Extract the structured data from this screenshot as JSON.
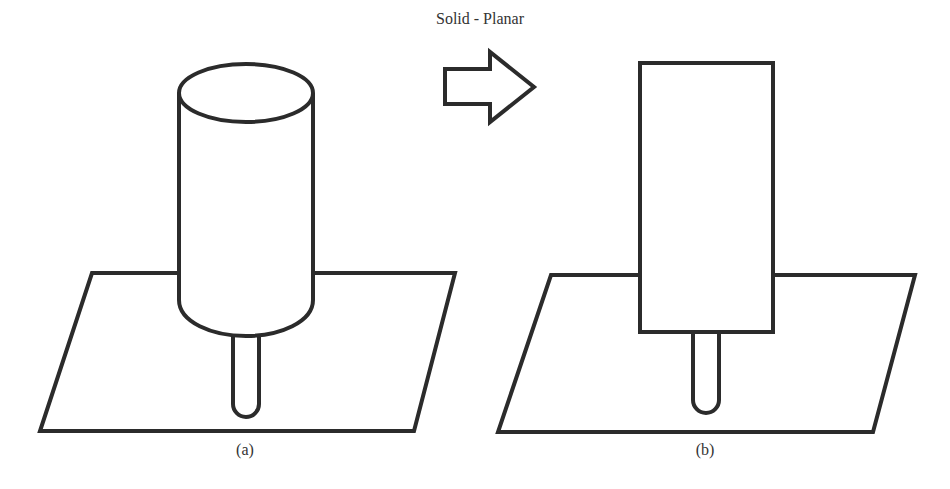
{
  "title": "Solid - Planar",
  "panels": [
    {
      "id": "a",
      "label": "(a)",
      "shape": "cylinder",
      "description": "Cylindrical solid on a stem above a planar surface"
    },
    {
      "id": "b",
      "label": "(b)",
      "shape": "rectangle",
      "description": "Solid approximated as planar rectangle on a stem above a planar surface"
    }
  ],
  "arrow": {
    "direction": "right",
    "icon": "right-arrow-icon"
  },
  "colors": {
    "stroke": "#2b2b2b",
    "fill": "#ffffff",
    "text": "#333333"
  }
}
